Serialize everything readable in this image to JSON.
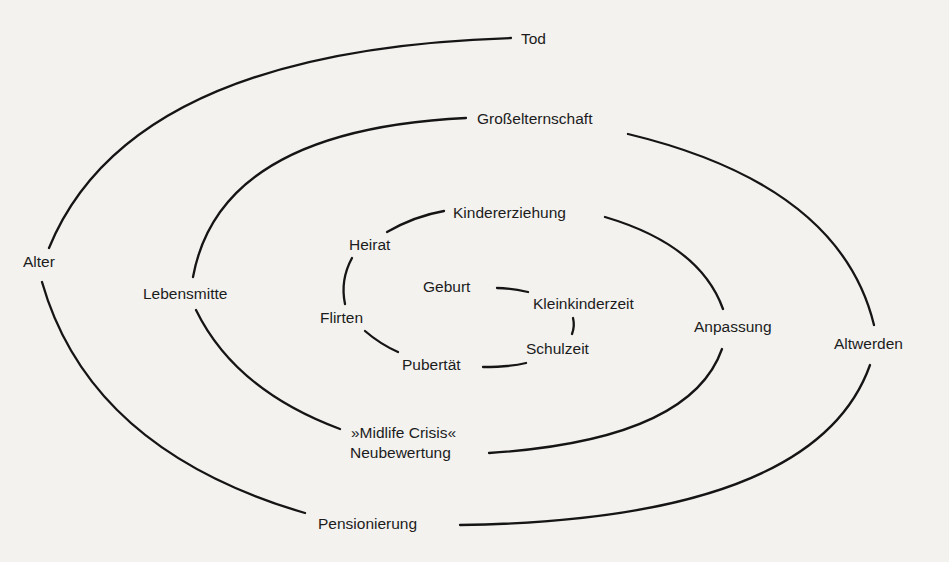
{
  "diagram": {
    "type": "spiral",
    "stages": [
      {
        "id": "geburt",
        "label": "Geburt"
      },
      {
        "id": "kleinkinderzeit",
        "label": "Kleinkinderzeit"
      },
      {
        "id": "schulzeit",
        "label": "Schulzeit"
      },
      {
        "id": "pubertaet",
        "label": "Pubertät"
      },
      {
        "id": "flirten",
        "label": "Flirten"
      },
      {
        "id": "heirat",
        "label": "Heirat"
      },
      {
        "id": "kindererziehung",
        "label": "Kindererziehung"
      },
      {
        "id": "anpassung",
        "label": "Anpassung"
      },
      {
        "id": "midlife_1",
        "label": "»Midlife Crisis«"
      },
      {
        "id": "midlife_2",
        "label": "Neubewertung"
      },
      {
        "id": "lebensmitte",
        "label": "Lebensmitte"
      },
      {
        "id": "grosselternschaft",
        "label": "Großelternschaft"
      },
      {
        "id": "altwerden",
        "label": "Altwerden"
      },
      {
        "id": "pensionierung",
        "label": "Pensionierung"
      },
      {
        "id": "alter",
        "label": "Alter"
      },
      {
        "id": "tod",
        "label": "Tod"
      }
    ],
    "colors": {
      "line": "#151515",
      "text": "#1c1c1c",
      "background": "#f3f2ef"
    }
  }
}
